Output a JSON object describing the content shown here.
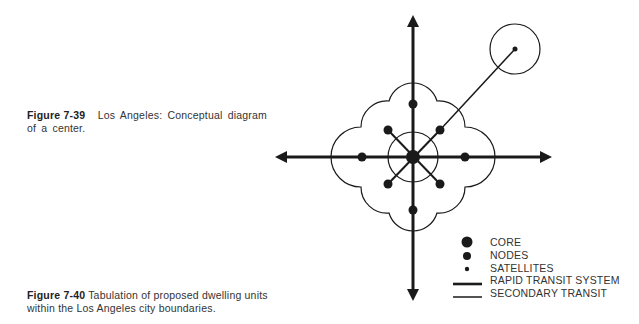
{
  "captions": [
    {
      "id": "fig-7-39",
      "label": "Figure 7-39",
      "text": "Los Angeles: Conceptual diagram of a center."
    },
    {
      "id": "fig-7-40",
      "label": "Figure 7-40",
      "text": "Tabulation of proposed dwelling units within the Los Angeles city boundaries."
    }
  ],
  "diagram": {
    "elements": [
      "core",
      "nodes",
      "satellite",
      "rapid-transit-axes",
      "secondary-transit-links",
      "inner-ring",
      "cloud-boundary",
      "satellite-ring"
    ],
    "node_count": 8,
    "satellite_count": 1
  },
  "legend": {
    "items": [
      {
        "symbol": "large-dot",
        "label": "CORE"
      },
      {
        "symbol": "medium-dot",
        "label": "NODES"
      },
      {
        "symbol": "small-dot",
        "label": "SATELLITES"
      },
      {
        "symbol": "thick-line",
        "label": "RAPID TRANSIT SYSTEM"
      },
      {
        "symbol": "thin-line",
        "label": "SECONDARY TRANSIT"
      }
    ]
  },
  "colors": {
    "ink": "#1a1a1a",
    "background": "#ffffff"
  }
}
